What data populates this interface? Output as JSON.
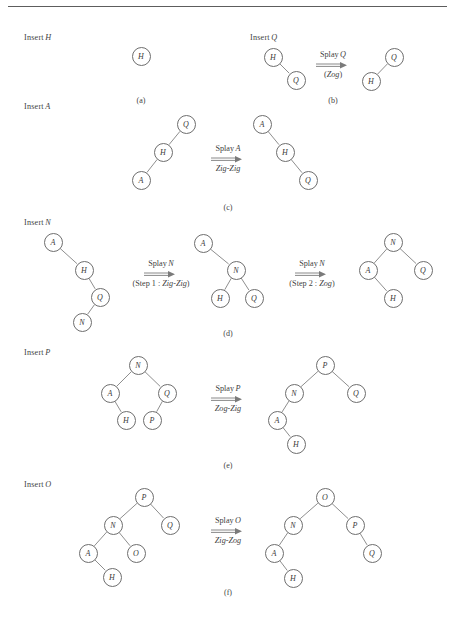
{
  "figure": {
    "width": 455,
    "height": 620,
    "rule_color": "#5d5d5d",
    "node_stroke": "#6e6e6e",
    "edge_stroke": "#7a7a7a",
    "text_color": "#3a3a3a",
    "arrow_glyph": "double-right-arrow"
  },
  "panels": [
    {
      "id": "a",
      "caption": "(a)",
      "caption_x": 141,
      "caption_y": 96,
      "insert_label": {
        "text": "Insert",
        "variable": "H",
        "x": 24,
        "y": 33
      },
      "operation": null,
      "trees": [
        {
          "name": "tree-a-1",
          "nodes": [
            {
              "label": "H",
              "x": 141,
              "y": 56
            }
          ],
          "edges": []
        }
      ]
    },
    {
      "id": "b",
      "caption": "(b)",
      "caption_x": 333,
      "caption_y": 96,
      "insert_label": {
        "text": "Insert",
        "variable": "Q",
        "x": 250,
        "y": 33
      },
      "operation": {
        "top_text": "Splay",
        "top_variable": "Q",
        "bottom_text": "(Zog)",
        "bottom_variable": "Zog",
        "bottom_is_paren": true,
        "x": 333,
        "y": 50
      },
      "trees": [
        {
          "name": "tree-b-before",
          "nodes": [
            {
              "label": "H",
              "x": 273,
              "y": 57
            },
            {
              "label": "Q",
              "x": 296,
              "y": 80
            }
          ],
          "edges": [
            [
              0,
              1
            ]
          ]
        },
        {
          "name": "tree-b-after",
          "nodes": [
            {
              "label": "Q",
              "x": 394,
              "y": 57
            },
            {
              "label": "H",
              "x": 371,
              "y": 81
            }
          ],
          "edges": [
            [
              0,
              1
            ]
          ]
        }
      ]
    },
    {
      "id": "c",
      "caption": "(c)",
      "caption_x": 228,
      "caption_y": 203,
      "insert_label": {
        "text": "Insert",
        "variable": "A",
        "x": 24,
        "y": 102
      },
      "operation": {
        "top_text": "Splay",
        "top_variable": "A",
        "bottom_text": "Zig-Zig",
        "bottom_variable": "Zig-Zig",
        "bottom_is_paren": false,
        "x": 228,
        "y": 144
      },
      "trees": [
        {
          "name": "tree-c-before",
          "nodes": [
            {
              "label": "Q",
              "x": 186,
              "y": 124
            },
            {
              "label": "H",
              "x": 163,
              "y": 152
            },
            {
              "label": "A",
              "x": 141,
              "y": 180
            }
          ],
          "edges": [
            [
              0,
              1
            ],
            [
              1,
              2
            ]
          ]
        },
        {
          "name": "tree-c-after",
          "nodes": [
            {
              "label": "A",
              "x": 262,
              "y": 124
            },
            {
              "label": "H",
              "x": 285,
              "y": 152
            },
            {
              "label": "Q",
              "x": 308,
              "y": 180
            }
          ],
          "edges": [
            [
              0,
              1
            ],
            [
              1,
              2
            ]
          ]
        }
      ]
    },
    {
      "id": "d",
      "caption": "(d)",
      "caption_x": 228,
      "caption_y": 329,
      "insert_label": {
        "text": "Insert",
        "variable": "N",
        "x": 24,
        "y": 218
      },
      "operation": {
        "top_text": "Splay",
        "top_variable": "N",
        "bottom_text": "(Step 1 :  Zig-Zig)",
        "bottom_variable": "Zig-Zig",
        "bottom_is_paren": true,
        "x": 161,
        "y": 259
      },
      "operation2": {
        "top_text": "Splay",
        "top_variable": "N",
        "bottom_text": "(Step 2 : Zog)",
        "bottom_variable": "Zog",
        "bottom_is_paren": true,
        "x": 312,
        "y": 259
      },
      "trees": [
        {
          "name": "tree-d-before",
          "nodes": [
            {
              "label": "A",
              "x": 53,
              "y": 242
            },
            {
              "label": "H",
              "x": 84,
              "y": 270
            },
            {
              "label": "Q",
              "x": 100,
              "y": 297
            },
            {
              "label": "N",
              "x": 82,
              "y": 322
            }
          ],
          "edges": [
            [
              0,
              1
            ],
            [
              1,
              2
            ],
            [
              2,
              3
            ]
          ]
        },
        {
          "name": "tree-d-middle",
          "nodes": [
            {
              "label": "A",
              "x": 203,
              "y": 243
            },
            {
              "label": "N",
              "x": 236,
              "y": 270
            },
            {
              "label": "H",
              "x": 220,
              "y": 298
            },
            {
              "label": "Q",
              "x": 254,
              "y": 298
            }
          ],
          "edges": [
            [
              0,
              1
            ],
            [
              1,
              2
            ],
            [
              1,
              3
            ]
          ]
        },
        {
          "name": "tree-d-after",
          "nodes": [
            {
              "label": "N",
              "x": 393,
              "y": 242
            },
            {
              "label": "A",
              "x": 368,
              "y": 270
            },
            {
              "label": "Q",
              "x": 423,
              "y": 270
            },
            {
              "label": "H",
              "x": 393,
              "y": 298
            }
          ],
          "edges": [
            [
              0,
              1
            ],
            [
              0,
              2
            ],
            [
              1,
              3
            ]
          ]
        }
      ]
    },
    {
      "id": "e",
      "caption": "(e)",
      "caption_x": 228,
      "caption_y": 461,
      "insert_label": {
        "text": "Insert",
        "variable": "P",
        "x": 24,
        "y": 348
      },
      "operation": {
        "top_text": "Splay",
        "top_variable": "P",
        "bottom_text": "Zog-Zig",
        "bottom_variable": "Zog-Zig",
        "bottom_is_paren": false,
        "x": 228,
        "y": 384
      },
      "trees": [
        {
          "name": "tree-e-before",
          "nodes": [
            {
              "label": "N",
              "x": 138,
              "y": 365
            },
            {
              "label": "A",
              "x": 110,
              "y": 393
            },
            {
              "label": "Q",
              "x": 167,
              "y": 393
            },
            {
              "label": "H",
              "x": 126,
              "y": 420
            },
            {
              "label": "P",
              "x": 152,
              "y": 420
            }
          ],
          "edges": [
            [
              0,
              1
            ],
            [
              0,
              2
            ],
            [
              1,
              3
            ],
            [
              2,
              4
            ]
          ]
        },
        {
          "name": "tree-e-after",
          "nodes": [
            {
              "label": "P",
              "x": 325,
              "y": 365
            },
            {
              "label": "N",
              "x": 294,
              "y": 393
            },
            {
              "label": "Q",
              "x": 356,
              "y": 393
            },
            {
              "label": "A",
              "x": 277,
              "y": 420
            },
            {
              "label": "H",
              "x": 296,
              "y": 444
            }
          ],
          "edges": [
            [
              0,
              1
            ],
            [
              0,
              2
            ],
            [
              1,
              3
            ],
            [
              3,
              4
            ]
          ]
        }
      ]
    },
    {
      "id": "f",
      "caption": "(f)",
      "caption_x": 228,
      "caption_y": 588,
      "insert_label": {
        "text": "Insert",
        "variable": "O",
        "x": 24,
        "y": 480
      },
      "operation": {
        "top_text": "Splay",
        "top_variable": "O",
        "bottom_text": "Zig-Zog",
        "bottom_variable": "Zig-Zog",
        "bottom_is_paren": false,
        "x": 228,
        "y": 516
      },
      "trees": [
        {
          "name": "tree-f-before",
          "nodes": [
            {
              "label": "P",
              "x": 144,
              "y": 497
            },
            {
              "label": "N",
              "x": 113,
              "y": 525
            },
            {
              "label": "Q",
              "x": 170,
              "y": 525
            },
            {
              "label": "A",
              "x": 88,
              "y": 553
            },
            {
              "label": "O",
              "x": 136,
              "y": 553
            },
            {
              "label": "H",
              "x": 112,
              "y": 577
            }
          ],
          "edges": [
            [
              0,
              1
            ],
            [
              0,
              2
            ],
            [
              1,
              3
            ],
            [
              1,
              4
            ],
            [
              3,
              5
            ]
          ]
        },
        {
          "name": "tree-f-after",
          "nodes": [
            {
              "label": "O",
              "x": 325,
              "y": 497
            },
            {
              "label": "N",
              "x": 293,
              "y": 525
            },
            {
              "label": "P",
              "x": 355,
              "y": 525
            },
            {
              "label": "A",
              "x": 274,
              "y": 553
            },
            {
              "label": "Q",
              "x": 372,
              "y": 553
            },
            {
              "label": "H",
              "x": 293,
              "y": 578
            }
          ],
          "edges": [
            [
              0,
              1
            ],
            [
              0,
              2
            ],
            [
              1,
              3
            ],
            [
              2,
              4
            ],
            [
              3,
              5
            ]
          ]
        }
      ]
    }
  ]
}
